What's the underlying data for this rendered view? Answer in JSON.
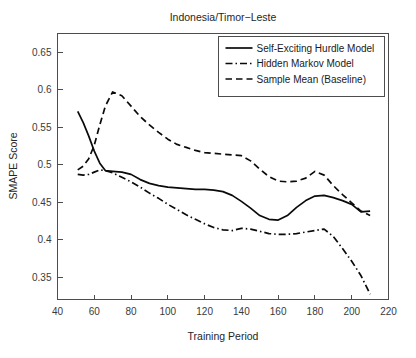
{
  "chart_data": {
    "type": "line",
    "title": "Indonesia/Timor−Leste",
    "xlabel": "Training Period",
    "ylabel": "SMAPE Score",
    "xlim": [
      40,
      220
    ],
    "ylim": [
      0.32,
      0.675
    ],
    "xticks": [
      40,
      60,
      80,
      100,
      120,
      140,
      160,
      180,
      200,
      220
    ],
    "xticklabels": [
      "40",
      "60",
      "80",
      "100",
      "120",
      "140",
      "160",
      "180",
      "200",
      "220"
    ],
    "yticks": [
      0.35,
      0.4,
      0.45,
      0.5,
      0.55,
      0.6,
      0.65
    ],
    "yticklabels": [
      "0.35",
      "0.4",
      "0.45",
      "0.5",
      "0.55",
      "0.6",
      "0.65"
    ],
    "grid": false,
    "legend_position": "top-right",
    "series": [
      {
        "name": "Self-Exciting Hurdle Model",
        "style": "solid",
        "x": [
          51,
          54,
          57,
          60,
          63,
          66,
          70,
          75,
          80,
          85,
          90,
          95,
          100,
          105,
          110,
          115,
          120,
          125,
          130,
          135,
          140,
          145,
          150,
          155,
          160,
          165,
          170,
          175,
          180,
          185,
          190,
          195,
          200,
          205,
          210
        ],
        "y": [
          0.571,
          0.556,
          0.538,
          0.518,
          0.502,
          0.492,
          0.491,
          0.49,
          0.487,
          0.48,
          0.475,
          0.472,
          0.47,
          0.469,
          0.468,
          0.467,
          0.467,
          0.466,
          0.464,
          0.459,
          0.451,
          0.442,
          0.432,
          0.427,
          0.426,
          0.432,
          0.443,
          0.452,
          0.458,
          0.459,
          0.456,
          0.452,
          0.447,
          0.437,
          0.438
        ]
      },
      {
        "name": "Hidden Markov Model",
        "style": "dashdot",
        "x": [
          51,
          54,
          57,
          60,
          63,
          66,
          70,
          75,
          80,
          85,
          90,
          95,
          100,
          105,
          110,
          115,
          120,
          125,
          130,
          135,
          140,
          145,
          150,
          155,
          160,
          165,
          170,
          175,
          180,
          185,
          190,
          195,
          200,
          205,
          210
        ],
        "y": [
          0.487,
          0.486,
          0.487,
          0.49,
          0.493,
          0.492,
          0.489,
          0.483,
          0.477,
          0.47,
          0.462,
          0.455,
          0.447,
          0.44,
          0.433,
          0.427,
          0.421,
          0.416,
          0.413,
          0.412,
          0.415,
          0.414,
          0.411,
          0.408,
          0.407,
          0.407,
          0.408,
          0.41,
          0.412,
          0.414,
          0.404,
          0.388,
          0.371,
          0.352,
          0.327
        ]
      },
      {
        "name": "Sample Mean (Baseline)",
        "style": "dashed",
        "x": [
          51,
          54,
          57,
          60,
          63,
          66,
          70,
          75,
          80,
          85,
          90,
          95,
          100,
          105,
          110,
          115,
          120,
          125,
          130,
          135,
          140,
          145,
          150,
          155,
          160,
          165,
          170,
          175,
          180,
          185,
          190,
          195,
          200,
          205,
          210
        ],
        "y": [
          0.493,
          0.498,
          0.508,
          0.526,
          0.553,
          0.578,
          0.597,
          0.592,
          0.578,
          0.564,
          0.553,
          0.543,
          0.534,
          0.527,
          0.523,
          0.519,
          0.516,
          0.515,
          0.514,
          0.513,
          0.512,
          0.505,
          0.494,
          0.484,
          0.478,
          0.477,
          0.478,
          0.482,
          0.491,
          0.486,
          0.472,
          0.46,
          0.449,
          0.438,
          0.432
        ]
      }
    ]
  },
  "legend": {
    "entries": [
      {
        "label": "Self-Exciting Hurdle Model",
        "style": "solid"
      },
      {
        "label": "Hidden Markov Model",
        "style": "dashdot"
      },
      {
        "label": "Sample Mean (Baseline)",
        "style": "dashed"
      }
    ]
  }
}
